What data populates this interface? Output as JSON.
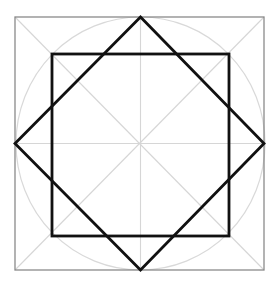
{
  "diagram": {
    "width": 277,
    "height": 284,
    "center": [
      140.5,
      143.5
    ],
    "colors": {
      "background": "#ffffff",
      "outer_square": "#8a8a8a",
      "guides": "#d6d6d6",
      "circle": "#d9d9d9",
      "shapes": "#111111"
    },
    "outer_square": {
      "x": 15,
      "y": 17,
      "w": 249,
      "h": 253
    },
    "inner_square": {
      "x": 52,
      "y": 54,
      "w": 177,
      "h": 182
    },
    "diamond": {
      "top": [
        140.5,
        17
      ],
      "right": [
        264,
        143.5
      ],
      "bottom": [
        140.5,
        270
      ],
      "left": [
        15,
        143.5
      ]
    },
    "circle": {
      "cx": 140.5,
      "cy": 143.5,
      "rx": 124.5,
      "ry": 126.5
    }
  }
}
